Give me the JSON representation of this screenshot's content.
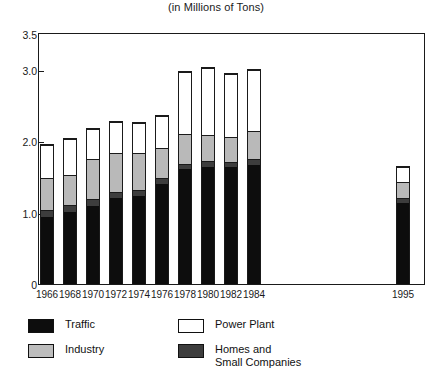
{
  "subtitle": "(in Millions of Tons)",
  "axes": {
    "y_ticks": [
      {
        "value": 3.5,
        "label": "3.5"
      },
      {
        "value": 3.0,
        "label": "3.0"
      },
      {
        "value": 2.0,
        "label": "2.0"
      },
      {
        "value": 1.0,
        "label": "1.0"
      },
      {
        "value": 0.0,
        "label": "0"
      }
    ]
  },
  "legend": {
    "left": [
      {
        "key": "traffic",
        "label": "Traffic",
        "color": "#0d0d0d",
        "swatch_class": "sw-traffic"
      },
      {
        "key": "industry",
        "label": "Industry",
        "color": "#bdbdbd",
        "swatch_class": "sw-industry"
      }
    ],
    "right": [
      {
        "key": "power",
        "label": "Power Plant",
        "color": "#ffffff",
        "swatch_class": "sw-power"
      },
      {
        "key": "homes",
        "label": "Homes and\nSmall Companies",
        "color": "#3d3d3d",
        "swatch_class": "sw-homes"
      }
    ]
  },
  "chart_data": {
    "type": "bar",
    "subtype": "stacked-vertical",
    "title": "",
    "subtitle": "(in Millions of Tons)",
    "xlabel": "",
    "ylabel": "",
    "ylim": [
      0,
      3.5
    ],
    "ytick_values": [
      0,
      1.0,
      2.0,
      3.0,
      3.5
    ],
    "ytick_labels": [
      "0",
      "1.0",
      "2.0",
      "3.0",
      "3.5"
    ],
    "grid": false,
    "legend_position": "below-plot",
    "units": "Millions of Tons",
    "categories": [
      "1966",
      "1968",
      "1970",
      "1972",
      "1974",
      "1976",
      "1978",
      "1980",
      "1982",
      "1984",
      "1995"
    ],
    "note": "A horizontal gap separates 1984 from 1995 on the category axis.",
    "stack_order_bottom_to_top": [
      "Traffic",
      "Homes and Small Companies",
      "Industry",
      "Power Plant"
    ],
    "series": [
      {
        "name": "Traffic",
        "color": "#0d0d0d",
        "values": [
          0.95,
          1.02,
          1.1,
          1.22,
          1.25,
          1.42,
          1.62,
          1.65,
          1.65,
          1.68,
          1.15
        ]
      },
      {
        "name": "Homes and Small Companies",
        "color": "#3d3d3d",
        "values": [
          0.1,
          0.1,
          0.1,
          0.08,
          0.08,
          0.08,
          0.08,
          0.08,
          0.08,
          0.08,
          0.08
        ]
      },
      {
        "name": "Industry",
        "color": "#bdbdbd",
        "values": [
          0.45,
          0.43,
          0.57,
          0.55,
          0.52,
          0.42,
          0.42,
          0.37,
          0.35,
          0.4,
          0.22
        ]
      },
      {
        "name": "Power Plant",
        "color": "#ffffff",
        "values": [
          0.47,
          0.5,
          0.42,
          0.45,
          0.43,
          0.46,
          0.88,
          0.95,
          0.89,
          0.86,
          0.21
        ]
      }
    ],
    "totals": [
      1.97,
      2.05,
      2.19,
      2.3,
      2.28,
      2.38,
      3.0,
      3.05,
      2.97,
      3.02,
      1.66
    ]
  },
  "layout": {
    "plot_left_px": 38,
    "plot_right_px": 425,
    "baseline_px": 267,
    "px_per_unit": 71.5,
    "bar_width_px": 14,
    "bar_left_px": [
      40,
      63,
      86,
      109,
      132,
      155,
      178,
      201,
      224,
      247,
      396
    ]
  }
}
